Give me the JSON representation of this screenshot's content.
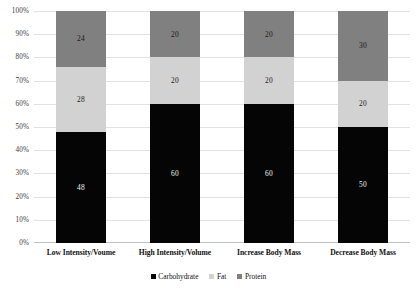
{
  "chart_data": {
    "type": "bar",
    "subtype": "100% stacked bar",
    "title": "",
    "xlabel": "",
    "ylabel": "",
    "ylim": [
      0,
      100
    ],
    "ytick_labels": [
      "0%",
      "10%",
      "20%",
      "30%",
      "40%",
      "50%",
      "60%",
      "70%",
      "80%",
      "90%",
      "100%"
    ],
    "ytick_values": [
      0,
      10,
      20,
      30,
      40,
      50,
      60,
      70,
      80,
      90,
      100
    ],
    "grid": true,
    "legend_position": "bottom-center",
    "categories": [
      "Low Intensity/Voume",
      "High Intensity/Volume",
      "Increase Body Mass",
      "Decrease Body Mass"
    ],
    "series": [
      {
        "name": "Carbohydrate",
        "color": "#050505",
        "values": [
          48,
          60,
          60,
          50
        ]
      },
      {
        "name": "Fat",
        "color": "#d2d2d2",
        "values": [
          28,
          20,
          20,
          20
        ]
      },
      {
        "name": "Protein",
        "color": "#808080",
        "values": [
          24,
          20,
          20,
          30
        ]
      }
    ],
    "data_labels": {
      "Low Intensity/Voume": {
        "Carbohydrate": "48",
        "Fat": "28",
        "Protein": "24"
      },
      "High Intensity/Volume": {
        "Carbohydrate": "60",
        "Fat": "20",
        "Protein": "20"
      },
      "Increase Body Mass": {
        "Carbohydrate": "60",
        "Fat": "20",
        "Protein": "20"
      },
      "Decrease Body Mass": {
        "Carbohydrate": "50",
        "Fat": "20",
        "Protein": "30"
      }
    }
  },
  "legend": {
    "items": [
      {
        "label": "Carbohydrate",
        "color": "#050505"
      },
      {
        "label": "Fat",
        "color": "#d2d2d2"
      },
      {
        "label": "Protein",
        "color": "#808080"
      }
    ]
  }
}
